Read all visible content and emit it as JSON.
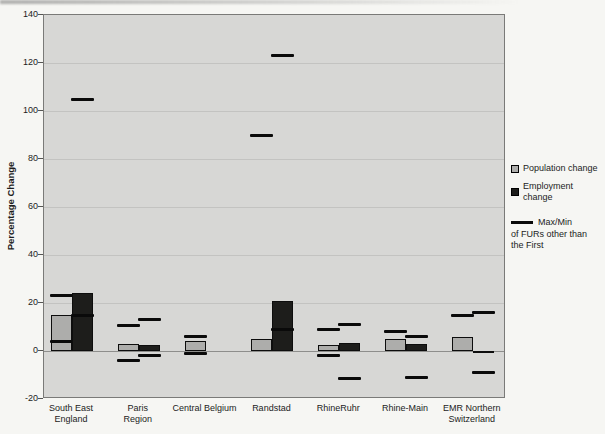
{
  "chart_data": {
    "type": "bar",
    "title": "",
    "ylabel": "Percentage Change",
    "xlabel": "",
    "grid": true,
    "legend_position": "right",
    "y_axis": {
      "min": -20,
      "max": 140,
      "tick_step": 20,
      "ticks": [
        140,
        120,
        100,
        80,
        60,
        40,
        20,
        0,
        -20
      ]
    },
    "categories": [
      "South East England",
      "Paris Region",
      "Central Belgium",
      "Randstad",
      "RhineRuhr",
      "Rhine-Main",
      "EMR Northern Switzerland"
    ],
    "category_label_lines": [
      [
        "South East",
        "England"
      ],
      [
        "Paris",
        "Region"
      ],
      [
        "Central Belgium"
      ],
      [
        "Randstad"
      ],
      [
        "RhineRuhr"
      ],
      [
        "Rhine-Main"
      ],
      [
        "EMR Northern",
        "Switzerland"
      ]
    ],
    "series": [
      {
        "name": "Population change",
        "color": "#adadab",
        "values": [
          15,
          3,
          4,
          5,
          2.5,
          5,
          6
        ],
        "max_other_furs": [
          23,
          10.5,
          6,
          90,
          9,
          8,
          15
        ],
        "min_other_furs": [
          4,
          -4,
          -1,
          null,
          -2,
          null,
          null
        ]
      },
      {
        "name": "Employment change",
        "color": "#1d1d1b",
        "values": [
          24,
          2.5,
          null,
          21,
          3.5,
          3,
          -1
        ],
        "max_other_furs": [
          105,
          13,
          null,
          123,
          11,
          6,
          16
        ],
        "min_other_furs": [
          15,
          -2,
          null,
          9,
          -11.5,
          -11,
          -9
        ]
      }
    ],
    "marker_legend": {
      "label": "Max/Min",
      "description_lines": [
        "of FURs other than",
        "the First"
      ]
    }
  },
  "colors": {
    "page_background": "#f6f6f3",
    "plot_background": "#d7d7d5",
    "gridline": "#c3c3c1",
    "zero_line": "#8e8e8c",
    "plot_border": "#7a7a78",
    "population_fill": "#adadab",
    "employment_fill": "#1d1d1b",
    "marker": "#0a0a0a",
    "text": "#1c1c1c"
  }
}
